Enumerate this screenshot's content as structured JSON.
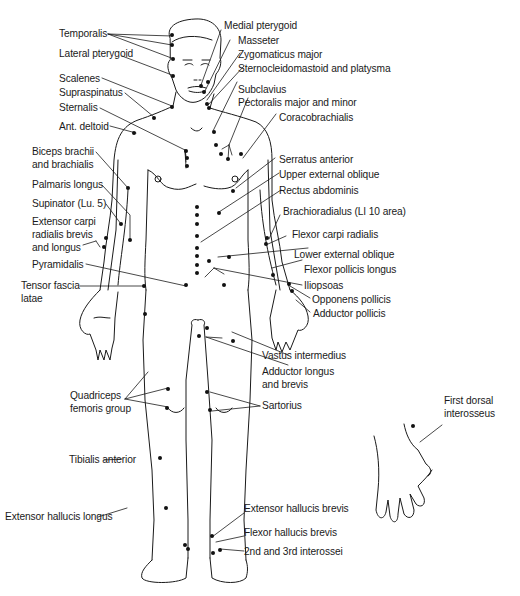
{
  "figure": {
    "type": "anatomical trigger point chart",
    "view": "anterior body with dorsal hand inset",
    "labels_left": [
      {
        "id": "temporalis",
        "text": "Temporalis"
      },
      {
        "id": "lateral-pterygoid",
        "text": "Lateral pterygoid"
      },
      {
        "id": "scalenes",
        "text": "Scalenes"
      },
      {
        "id": "supraspinatus",
        "text": "Supraspinatus"
      },
      {
        "id": "sternalis",
        "text": "Sternalis"
      },
      {
        "id": "ant-deltoid",
        "text": "Ant. deltoid"
      },
      {
        "id": "biceps-1",
        "text": "Biceps brachii"
      },
      {
        "id": "biceps-2",
        "text": "and brachialis"
      },
      {
        "id": "palmaris",
        "text": "Palmaris longus"
      },
      {
        "id": "supinator",
        "text": "Supinator (Lu. 5)"
      },
      {
        "id": "ecr-1",
        "text": "Extensor carpi"
      },
      {
        "id": "ecr-2",
        "text": "radialis brevis"
      },
      {
        "id": "ecr-3",
        "text": "and longus"
      },
      {
        "id": "pyramidalis",
        "text": "Pyramidalis"
      },
      {
        "id": "tfl-1",
        "text": "Tensor fascia"
      },
      {
        "id": "tfl-2",
        "text": "latae"
      },
      {
        "id": "quad-1",
        "text": "Quadriceps"
      },
      {
        "id": "quad-2",
        "text": "femoris group"
      },
      {
        "id": "tibialis",
        "text": "Tibialis anterior"
      },
      {
        "id": "ehl",
        "text": "Extensor hallucis longus"
      }
    ],
    "labels_right": [
      {
        "id": "medial-pterygoid",
        "text": "Medial pterygoid"
      },
      {
        "id": "masseter",
        "text": "Masseter"
      },
      {
        "id": "zygomaticus",
        "text": "Zygomaticus major"
      },
      {
        "id": "scm",
        "text": "Sternocleidomastoid and platysma"
      },
      {
        "id": "subclavius",
        "text": "Subclavius"
      },
      {
        "id": "pectoralis",
        "text": "Pectoralis major and minor"
      },
      {
        "id": "coracobrachialis",
        "text": "Coracobrachialis"
      },
      {
        "id": "serratus",
        "text": "Serratus anterior"
      },
      {
        "id": "upper-ext-oblique",
        "text": "Upper external oblique"
      },
      {
        "id": "rectus",
        "text": "Rectus abdominis"
      },
      {
        "id": "brachioradialis",
        "text": "Brachioradialus (LI 10 area)"
      },
      {
        "id": "fcr",
        "text": "Flexor carpi radialis"
      },
      {
        "id": "lower-ext-oblique",
        "text": "Lower external oblique"
      },
      {
        "id": "fpl",
        "text": "Flexor pollicis longus"
      },
      {
        "id": "iliopsoas",
        "text": "Iliopsoas"
      },
      {
        "id": "opponens",
        "text": "Opponens pollicis"
      },
      {
        "id": "adductor-pollicis",
        "text": "Adductor pollicis"
      },
      {
        "id": "vastus",
        "text": "Vastus intermedius"
      },
      {
        "id": "adductor-1",
        "text": "Adductor longus"
      },
      {
        "id": "adductor-2",
        "text": "and brevis"
      },
      {
        "id": "sartorius",
        "text": "Sartorius"
      },
      {
        "id": "fdi-1",
        "text": "First dorsal"
      },
      {
        "id": "fdi-2",
        "text": "interosseus"
      },
      {
        "id": "ehb",
        "text": "Extensor hallucis brevis"
      },
      {
        "id": "fhb",
        "text": "Flexor hallucis brevis"
      },
      {
        "id": "interossei",
        "text": "2nd and 3rd interossei"
      }
    ]
  }
}
